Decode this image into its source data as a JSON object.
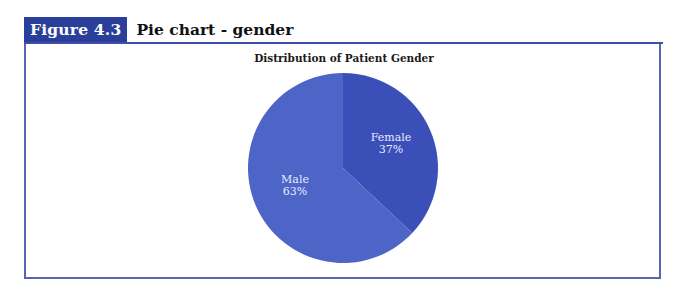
{
  "figure": {
    "label": "Figure 4.3",
    "title": "Pie chart - gender"
  },
  "colors": {
    "header_bg": "#2a3f9a",
    "frame": "#5b64b4",
    "female": "#3a50b8",
    "male": "#4c65c6"
  },
  "chart_data": {
    "type": "pie",
    "title": "Distribution of Patient Gender",
    "categories": [
      "Female",
      "Male"
    ],
    "values": [
      37,
      63
    ],
    "unit": "%",
    "labels": [
      "Female\n37%",
      "Male\n63%"
    ],
    "start_angle_deg": 0,
    "direction": "clockwise",
    "legend": "none"
  }
}
